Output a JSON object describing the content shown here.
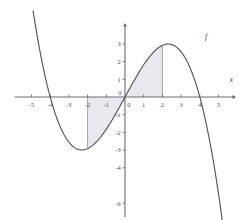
{
  "figure": {
    "background_color": "#ffffff",
    "curve_color": "#55555f",
    "axis_color": "#6b6b74",
    "shade_color": "#e8e8ee",
    "shade_edge_color": "#9a9aa6",
    "label_color": "#4a4a52"
  },
  "chart_data": {
    "type": "line",
    "title": "",
    "subtitle": "",
    "xlabel": "x",
    "ylabel": "",
    "grid": false,
    "legend_position": "inline-right",
    "xlim": [
      -5.9,
      5.7
    ],
    "ylim": [
      -6.8,
      3.9
    ],
    "x_ticks": [
      -5,
      -4,
      -3,
      -2,
      -1,
      0,
      1,
      2,
      3,
      4,
      5
    ],
    "x_tick_labels": [
      "-5",
      "-4",
      "-3",
      "-2",
      "-1",
      "0",
      "1",
      "2",
      "3",
      "4",
      "5"
    ],
    "y_ticks": [
      -6,
      -4,
      -3,
      -2,
      -1,
      1,
      2,
      3
    ],
    "y_tick_labels": [
      "-6",
      "-4",
      "-3",
      "-2",
      "-1",
      "1",
      "2",
      "3"
    ],
    "origin_label": "0",
    "series": [
      {
        "name": "f",
        "label": "f",
        "color": "#55555f",
        "expression": "f(x) = 0.1215*x*(16 - x^2)",
        "roots": [
          -4,
          0,
          4
        ],
        "local_minimum": {
          "x": -2.31,
          "y": -3.0
        },
        "local_maximum": {
          "x": 2.31,
          "y": 3.0
        },
        "sampled_points": [
          {
            "x": -5.0,
            "y": 5.47
          },
          {
            "x": -4.5,
            "y": 2.19
          },
          {
            "x": -4.0,
            "y": 0.0
          },
          {
            "x": -3.5,
            "y": -1.57
          },
          {
            "x": -3.0,
            "y": -2.55
          },
          {
            "x": -2.5,
            "y": -2.96
          },
          {
            "x": -2.31,
            "y": -3.0
          },
          {
            "x": -2.0,
            "y": -2.92
          },
          {
            "x": -1.5,
            "y": -2.51
          },
          {
            "x": -1.0,
            "y": -1.82
          },
          {
            "x": -0.5,
            "y": -0.96
          },
          {
            "x": 0.0,
            "y": 0.0
          },
          {
            "x": 0.5,
            "y": 0.96
          },
          {
            "x": 1.0,
            "y": 1.82
          },
          {
            "x": 1.5,
            "y": 2.51
          },
          {
            "x": 2.0,
            "y": 2.92
          },
          {
            "x": 2.31,
            "y": 3.0
          },
          {
            "x": 2.5,
            "y": 2.96
          },
          {
            "x": 3.0,
            "y": 2.55
          },
          {
            "x": 3.5,
            "y": 1.57
          },
          {
            "x": 4.0,
            "y": 0.0
          },
          {
            "x": 4.5,
            "y": -2.19
          },
          {
            "x": 5.0,
            "y": -5.47
          },
          {
            "x": 5.2,
            "y": -6.8
          }
        ]
      }
    ],
    "shaded_regions": [
      {
        "name": "left-shaded-region",
        "x_from": -2,
        "x_to": 0,
        "between": "curve-and-x-axis",
        "sign": "negative",
        "fill": "#e8e8ee",
        "boundary_line_x": -2
      },
      {
        "name": "right-shaded-region",
        "x_from": 0,
        "x_to": 2,
        "between": "curve-and-x-axis",
        "sign": "positive",
        "fill": "#e8e8ee",
        "boundary_line_x": 2
      }
    ],
    "annotations": [
      {
        "name": "curve-label",
        "text": "f",
        "x": 4.28,
        "y": 3.28
      },
      {
        "name": "x-axis-label",
        "text": "x",
        "x": 5.6,
        "y": 0.82
      }
    ]
  }
}
